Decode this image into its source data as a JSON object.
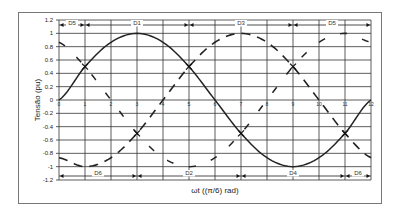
{
  "chart_data": {
    "type": "line",
    "title": "",
    "xlabel": "ωt ((π/6) rad)",
    "ylabel": "Tensão (pu)",
    "xlim": [
      0,
      12
    ],
    "ylim": [
      -1.2,
      1.2
    ],
    "grid": true,
    "legend": null,
    "x_ticks": [
      "0",
      "1",
      "2",
      "3",
      "4",
      "5",
      "6",
      "7",
      "8",
      "9",
      "10",
      "11",
      "12"
    ],
    "y_ticks": [
      "1.2",
      "1",
      "0.8",
      "0.6",
      "0.4",
      "0.2",
      "0",
      "-0.2",
      "-0.4",
      "-0.6",
      "-0.8",
      "-1",
      "-1.2"
    ],
    "x": [
      0,
      1,
      2,
      3,
      4,
      5,
      6,
      7,
      8,
      9,
      10,
      11,
      12
    ],
    "series": [
      {
        "name": "Phase A (solid)",
        "style": "solid",
        "values": [
          0,
          0.5,
          0.866,
          1,
          0.866,
          0.5,
          0,
          -0.5,
          -0.866,
          -1,
          -0.866,
          -0.5,
          0
        ]
      },
      {
        "name": "Phase B (long dash)",
        "style": "long-dash",
        "values": [
          -0.866,
          -1,
          -0.866,
          -0.5,
          0,
          0.5,
          0.866,
          1,
          0.866,
          0.5,
          0,
          -0.5,
          -0.866
        ]
      },
      {
        "name": "Phase C (sparse dash)",
        "style": "sparse-dash",
        "values": [
          0.866,
          0.5,
          0,
          -0.5,
          -0.866,
          -1,
          -0.866,
          -0.5,
          0,
          0.5,
          0.866,
          1,
          0.866
        ]
      }
    ],
    "annotations": {
      "top": [
        {
          "label": "D5",
          "from": 0,
          "to": 1
        },
        {
          "label": "D1",
          "from": 1,
          "to": 5
        },
        {
          "label": "D3",
          "from": 5,
          "to": 9
        },
        {
          "label": "D5",
          "from": 9,
          "to": 12
        }
      ],
      "bottom": [
        {
          "label": "D6",
          "from": 0,
          "to": 3
        },
        {
          "label": "D2",
          "from": 3,
          "to": 7
        },
        {
          "label": "D4",
          "from": 7,
          "to": 11
        },
        {
          "label": "D6",
          "from": 11,
          "to": 12
        }
      ],
      "crossings": [
        {
          "x": 3,
          "y": -0.5
        },
        {
          "x": 5,
          "y": 0.5
        },
        {
          "x": 7,
          "y": -0.5
        },
        {
          "x": 9,
          "y": 0.5
        },
        {
          "x": 11,
          "y": -0.5
        },
        {
          "x": 1,
          "y": 0.5
        }
      ]
    }
  }
}
